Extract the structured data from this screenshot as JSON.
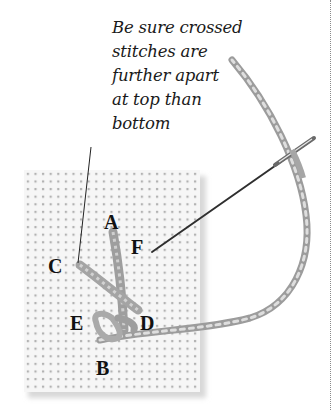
{
  "caption": {
    "lines": [
      "Be sure crossed",
      "stitches are",
      "further apart",
      "at top than",
      "bottom"
    ]
  },
  "labels": {
    "A": "A",
    "B": "B",
    "C": "C",
    "D": "D",
    "E": "E",
    "F": "F"
  },
  "colors": {
    "background": "#ffffff",
    "fabric": "#f4f4f4",
    "fabric_holes": "#a8a8a8",
    "thread": "#9a9a9a",
    "thread_highlight": "#d6d6d6",
    "needle": "#3a3a3a",
    "text": "#1a1a1a",
    "rule": "#8a8a8a"
  },
  "icons": {
    "needle": "needle-icon",
    "thread": "thread-icon",
    "fabric": "aida-fabric"
  }
}
